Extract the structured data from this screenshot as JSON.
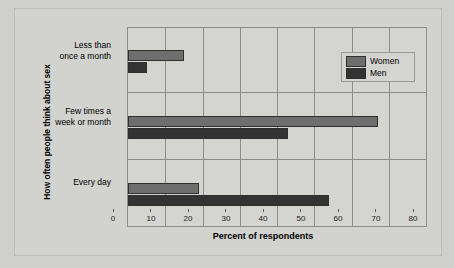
{
  "chart_data": {
    "type": "bar",
    "orientation": "horizontal",
    "title": "",
    "xlabel": "Percent of respondents",
    "ylabel": "How often people think about sex",
    "categories": [
      "Every day",
      "Few times a week or month",
      "Less than once a month"
    ],
    "category_lines": [
      [
        "Less than",
        "once a month"
      ],
      [
        "Few times a",
        "week or month"
      ],
      [
        "Every day"
      ]
    ],
    "series": [
      {
        "name": "Women",
        "color": "#6e6e6e",
        "values": [
          19,
          67,
          15
        ]
      },
      {
        "name": "Men",
        "color": "#333333",
        "values": [
          54,
          43,
          5
        ]
      }
    ],
    "xlim": [
      0,
      80
    ],
    "xticks": [
      0,
      10,
      20,
      30,
      40,
      50,
      60,
      70,
      80
    ],
    "xtick_labels": [
      "0",
      "10",
      "20",
      "30",
      "40",
      "50",
      "60",
      "70",
      "80"
    ],
    "grid": true,
    "legend_position": "top-right",
    "legend_entries": [
      "Women",
      "Men"
    ],
    "background_color": "#d2d2ce",
    "axis_color": "#8d8d88"
  }
}
